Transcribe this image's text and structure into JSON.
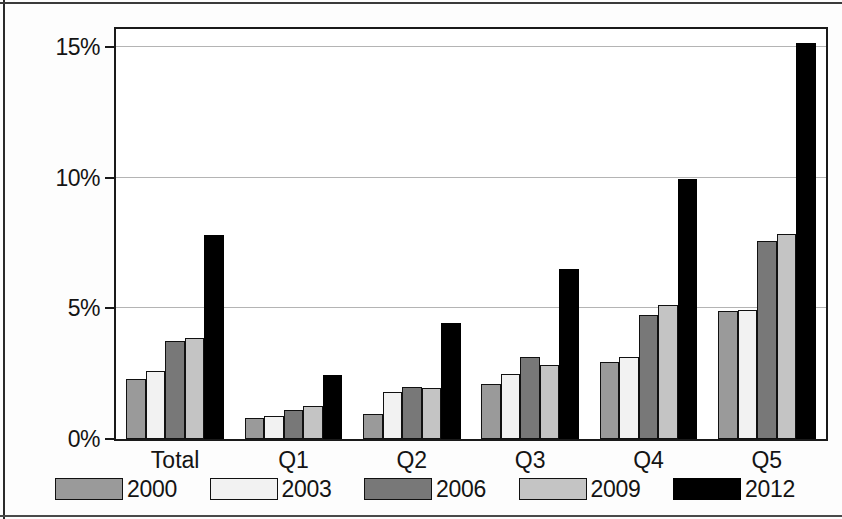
{
  "chart_data": {
    "type": "bar",
    "title": "",
    "subtitle": "",
    "xlabel": "",
    "ylabel": "",
    "categories": [
      "Total",
      "Q1",
      "Q2",
      "Q3",
      "Q4",
      "Q5"
    ],
    "series": [
      {
        "name": "2000",
        "color": "#9a9a9a",
        "values": [
          2.3,
          0.8,
          0.95,
          2.1,
          2.95,
          4.9
        ]
      },
      {
        "name": "2003",
        "color": "#f2f2f2",
        "values": [
          2.6,
          0.9,
          1.8,
          2.5,
          3.15,
          4.95
        ]
      },
      {
        "name": "2006",
        "color": "#787878",
        "values": [
          3.75,
          1.1,
          2.0,
          3.15,
          4.75,
          7.6
        ]
      },
      {
        "name": "2009",
        "color": "#c4c4c4",
        "values": [
          3.85,
          1.25,
          1.95,
          2.85,
          5.15,
          7.85
        ]
      },
      {
        "name": "2012",
        "color": "#000000",
        "values": [
          7.8,
          2.45,
          4.45,
          6.5,
          9.95,
          15.15
        ]
      }
    ],
    "ylim": [
      0,
      15.7
    ],
    "yticks": [
      0,
      5,
      10,
      15
    ],
    "ytick_labels": [
      "0%",
      "5%",
      "10%",
      "15%"
    ],
    "grid": true,
    "grid_axis": "y",
    "legend_position": "bottom",
    "legend_entries": [
      "2000",
      "2003",
      "2006",
      "2009",
      "2012"
    ],
    "value_unit": "percent"
  },
  "axis": {
    "y_labels": [
      "15%",
      "10%",
      "5%",
      "0%"
    ]
  },
  "legend": {
    "items": [
      {
        "label": "2000"
      },
      {
        "label": "2003"
      },
      {
        "label": "2006"
      },
      {
        "label": "2009"
      },
      {
        "label": "2012"
      }
    ]
  }
}
